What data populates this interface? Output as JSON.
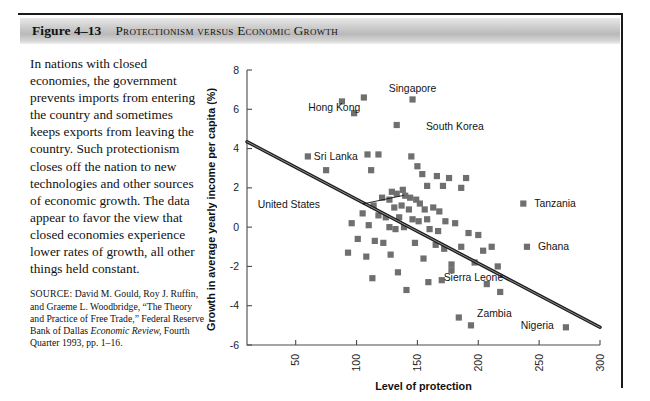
{
  "figure": {
    "number": "Figure 4–13",
    "title": "Protectionism versus Economic Growth"
  },
  "body": {
    "paragraph": "In nations with closed economies, the government prevents imports from entering the country and sometimes keeps exports from leaving the country. Such protectionism closes off the nation to new technologies and other sources of economic growth. The data appear to favor the view that closed economies experience lower rates of growth, all other things held constant.",
    "source_label": "SOURCE:",
    "source_line1": " David M. Gould, Roy J. Ruffin, and Graeme L. Woodbridge, “The Theory and Practice of Free Trade,” Federal Reserve Bank of Dallas ",
    "source_italic": "Economic Review,",
    "source_line2": " Fourth Quarter 1993, pp. 1–16."
  },
  "chart_data": {
    "type": "scatter",
    "title": "",
    "xlabel": "Level of protection",
    "ylabel": "Growth in average yearly income per capita (%)",
    "xlim": [
      10,
      300
    ],
    "ylim": [
      -6,
      8
    ],
    "xticks": [
      50,
      100,
      150,
      200,
      250,
      300
    ],
    "xtick_labels": [
      "50",
      "100",
      "150",
      "200",
      "250",
      "300"
    ],
    "yticks": [
      -6,
      -4,
      -2,
      0,
      2,
      4,
      6,
      8
    ],
    "ytick_labels": [
      "-6",
      "-4",
      "-2",
      "0",
      "2",
      "4",
      "6",
      "8"
    ],
    "grid": false,
    "legend": null,
    "marker_color": "#6f6f6f",
    "marker_shape": "square",
    "trendline": {
      "label": "fitted regression line",
      "x": [
        10,
        300
      ],
      "y": [
        4.35,
        -5.1
      ],
      "color": "#1c1c1c"
    },
    "points": [
      {
        "x": 88,
        "y": 6.4
      },
      {
        "x": 106,
        "y": 6.6
      },
      {
        "x": 146,
        "y": 6.5
      },
      {
        "x": 98,
        "y": 5.8
      },
      {
        "x": 133,
        "y": 5.2
      },
      {
        "x": 60,
        "y": 3.6
      },
      {
        "x": 109,
        "y": 3.7
      },
      {
        "x": 118,
        "y": 3.7
      },
      {
        "x": 145,
        "y": 3.6
      },
      {
        "x": 75,
        "y": 2.9
      },
      {
        "x": 112,
        "y": 2.9
      },
      {
        "x": 150,
        "y": 3.1
      },
      {
        "x": 154,
        "y": 2.7
      },
      {
        "x": 166,
        "y": 2.6
      },
      {
        "x": 176,
        "y": 2.5
      },
      {
        "x": 190,
        "y": 2.5
      },
      {
        "x": 158,
        "y": 2.1
      },
      {
        "x": 171,
        "y": 2.1
      },
      {
        "x": 186,
        "y": 2.0
      },
      {
        "x": 138,
        "y": 1.9
      },
      {
        "x": 129,
        "y": 1.8
      },
      {
        "x": 133,
        "y": 1.7
      },
      {
        "x": 140,
        "y": 1.6
      },
      {
        "x": 121,
        "y": 1.5
      },
      {
        "x": 127,
        "y": 1.4
      },
      {
        "x": 144,
        "y": 1.5
      },
      {
        "x": 149,
        "y": 1.4
      },
      {
        "x": 152,
        "y": 1.2
      },
      {
        "x": 114,
        "y": 1.1
      },
      {
        "x": 131,
        "y": 1.0
      },
      {
        "x": 137,
        "y": 1.1
      },
      {
        "x": 143,
        "y": 0.9
      },
      {
        "x": 156,
        "y": 0.9
      },
      {
        "x": 163,
        "y": 1.0
      },
      {
        "x": 168,
        "y": 0.8
      },
      {
        "x": 105,
        "y": 0.7
      },
      {
        "x": 118,
        "y": 0.6
      },
      {
        "x": 124,
        "y": 0.5
      },
      {
        "x": 135,
        "y": 0.5
      },
      {
        "x": 146,
        "y": 0.4
      },
      {
        "x": 151,
        "y": 0.3
      },
      {
        "x": 158,
        "y": 0.4
      },
      {
        "x": 173,
        "y": 0.3
      },
      {
        "x": 181,
        "y": 0.2
      },
      {
        "x": 96,
        "y": 0.2
      },
      {
        "x": 110,
        "y": 0.1
      },
      {
        "x": 127,
        "y": 0.0
      },
      {
        "x": 132,
        "y": -0.1
      },
      {
        "x": 139,
        "y": 0.0
      },
      {
        "x": 160,
        "y": -0.1
      },
      {
        "x": 167,
        "y": -0.2
      },
      {
        "x": 192,
        "y": -0.3
      },
      {
        "x": 200,
        "y": -0.4
      },
      {
        "x": 101,
        "y": -0.6
      },
      {
        "x": 115,
        "y": -0.7
      },
      {
        "x": 122,
        "y": -0.8
      },
      {
        "x": 148,
        "y": -0.8
      },
      {
        "x": 165,
        "y": -0.9
      },
      {
        "x": 172,
        "y": -1.1
      },
      {
        "x": 186,
        "y": -1.0
      },
      {
        "x": 204,
        "y": -1.2
      },
      {
        "x": 211,
        "y": -1.0
      },
      {
        "x": 93,
        "y": -1.3
      },
      {
        "x": 108,
        "y": -1.5
      },
      {
        "x": 128,
        "y": -1.4
      },
      {
        "x": 155,
        "y": -1.6
      },
      {
        "x": 178,
        "y": -1.9
      },
      {
        "x": 178,
        "y": -2.2
      },
      {
        "x": 197,
        "y": -1.8
      },
      {
        "x": 216,
        "y": -2.0
      },
      {
        "x": 134,
        "y": -2.3
      },
      {
        "x": 113,
        "y": -2.6
      },
      {
        "x": 159,
        "y": -2.8
      },
      {
        "x": 170,
        "y": -2.7
      },
      {
        "x": 207,
        "y": -2.9
      },
      {
        "x": 218,
        "y": -3.3
      },
      {
        "x": 141,
        "y": -3.2
      },
      {
        "x": 184,
        "y": -4.6
      },
      {
        "x": 194,
        "y": -5.0
      },
      {
        "x": 272,
        "y": -5.1
      },
      {
        "x": 237,
        "y": 1.2
      },
      {
        "x": 240,
        "y": -1.0
      }
    ],
    "annotations": [
      {
        "label": "Singapore",
        "lx": 146,
        "ly": 7.05,
        "anchor": "middle",
        "leader": false
      },
      {
        "label": "Hong Kong",
        "lx": 103,
        "ly": 6.1,
        "anchor": "end",
        "leader": false
      },
      {
        "label": "South Korea",
        "lx": 157,
        "ly": 5.15,
        "anchor": "start",
        "leader": false
      },
      {
        "label": "Sri Lanka",
        "lx": 101,
        "ly": 3.58,
        "anchor": "end",
        "leader": false
      },
      {
        "label": "United States",
        "lx": 70,
        "ly": 1.18,
        "anchor": "end",
        "leader": true,
        "x1": 105,
        "y1": 1.18,
        "x2": 139,
        "y2": 1.62
      },
      {
        "label": "Tanzania",
        "lx": 246,
        "ly": 1.2,
        "anchor": "start",
        "leader": false
      },
      {
        "label": "Ghana",
        "lx": 249,
        "ly": -1.0,
        "anchor": "start",
        "leader": false
      },
      {
        "label": "Sierra Leone",
        "lx": 196,
        "ly": -2.55,
        "anchor": "middle",
        "leader": false
      },
      {
        "label": "Zambia",
        "lx": 199,
        "ly": -4.4,
        "anchor": "start",
        "leader": false
      },
      {
        "label": "Nigeria",
        "lx": 262,
        "ly": -5.0,
        "anchor": "end",
        "leader": false
      }
    ]
  }
}
